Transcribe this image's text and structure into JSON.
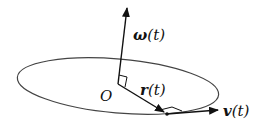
{
  "diagram": {
    "labels": {
      "omega": "ω",
      "omega_arg": "(t)",
      "origin": "O",
      "r": "r",
      "r_arg": "(t)",
      "v": "v",
      "v_arg": "(t)"
    },
    "elements": [
      "orbit-ellipse",
      "angular-velocity-vector",
      "position-vector",
      "velocity-vector",
      "right-angle-markers",
      "moving-point"
    ],
    "colors": {
      "stroke": "#111111",
      "orbit": "#444444",
      "background": "#ffffff"
    }
  }
}
